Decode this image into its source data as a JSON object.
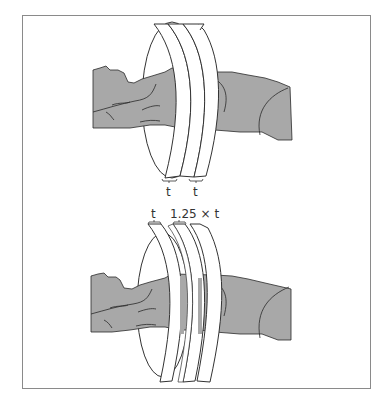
{
  "figure": {
    "frame_color": "#8a8a8a",
    "body_fill": "#a8a8a8",
    "body_stroke": "#2a2a2a",
    "ring_fill": "#ffffff",
    "ring_stroke": "#333333"
  },
  "panels": [
    {
      "id": "contiguous",
      "description": "Three adjacent slice rings around a patient, no gap",
      "labels": [
        "t",
        "t"
      ]
    },
    {
      "id": "spaced",
      "description": "Three slice rings separated by gaps",
      "labels": [
        "t",
        "1.25 × t"
      ]
    }
  ]
}
